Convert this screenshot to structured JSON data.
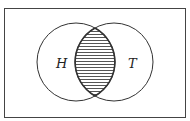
{
  "diagram": {
    "type": "venn",
    "sets": [
      {
        "label": "H"
      },
      {
        "label": "T"
      }
    ],
    "shaded_region": "intersection",
    "colors": {
      "stroke": "#333333",
      "hatch": "#555555",
      "background": "#ffffff"
    }
  }
}
